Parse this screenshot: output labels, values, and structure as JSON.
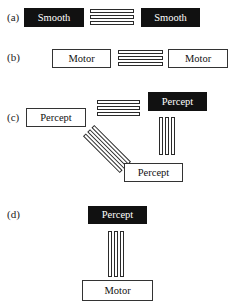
{
  "panels": {
    "a": {
      "label": "(a)",
      "left_box": {
        "text": "Smooth",
        "style": "black"
      },
      "connector": {
        "orientation": "horizontal",
        "bar_count": 3
      },
      "right_box": {
        "text": "Smooth",
        "style": "black"
      }
    },
    "b": {
      "label": "(b)",
      "left_box": {
        "text": "Motor",
        "style": "white"
      },
      "connector": {
        "orientation": "horizontal",
        "bar_count": 3
      },
      "right_box": {
        "text": "Motor",
        "style": "white"
      }
    },
    "c": {
      "label": "(c)",
      "left_box": {
        "text": "Percept",
        "style": "white"
      },
      "top_right_box": {
        "text": "Percept",
        "style": "black"
      },
      "bottom_box": {
        "text": "Percept",
        "style": "white"
      },
      "connectors": [
        {
          "orientation": "horizontal",
          "bar_count": 3,
          "between": "left_box-top_right_box"
        },
        {
          "orientation": "vertical",
          "bar_count": 3,
          "between": "top_right_box-bottom_box"
        },
        {
          "orientation": "diagonal",
          "bar_count": 3,
          "between": "left_box-bottom_box"
        }
      ]
    },
    "d": {
      "label": "(d)",
      "top_box": {
        "text": "Percept",
        "style": "black"
      },
      "connector": {
        "orientation": "vertical",
        "bar_count": 3
      },
      "bottom_box": {
        "text": "Motor",
        "style": "white"
      }
    }
  },
  "colors": {
    "black_box": "#111111",
    "white_box_border": "#333333",
    "background": "#ffffff"
  }
}
